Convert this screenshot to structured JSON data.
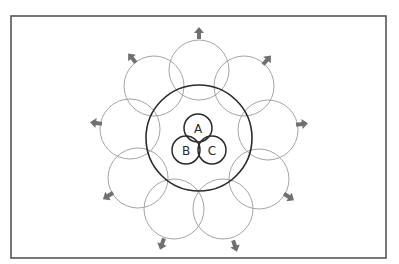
{
  "diagram": {
    "type": "venn-expansion",
    "frame": {
      "x": 11,
      "y": 16,
      "width": 375,
      "height": 242,
      "stroke": "#555555"
    },
    "center": {
      "x": 199,
      "y": 138
    },
    "main_circle": {
      "r": 53,
      "stroke": "#2a2a2a"
    },
    "inner_sets": [
      {
        "label": "A",
        "cx": 198,
        "cy": 128,
        "r": 14
      },
      {
        "label": "B",
        "cx": 186,
        "cy": 150,
        "r": 14
      },
      {
        "label": "C",
        "cx": 212,
        "cy": 150,
        "r": 14
      }
    ],
    "outer_circles": [
      {
        "cx": 199,
        "cy": 70,
        "r": 30
      },
      {
        "cx": 244,
        "cy": 86,
        "r": 30
      },
      {
        "cx": 268,
        "cy": 130,
        "r": 30
      },
      {
        "cx": 259,
        "cy": 179,
        "r": 30
      },
      {
        "cx": 223,
        "cy": 209,
        "r": 30
      },
      {
        "cx": 174,
        "cy": 209,
        "r": 30
      },
      {
        "cx": 138,
        "cy": 178,
        "r": 30
      },
      {
        "cx": 130,
        "cy": 129,
        "r": 30
      },
      {
        "cx": 154,
        "cy": 86,
        "r": 30
      }
    ],
    "arrows": [
      {
        "x": 199,
        "y": 33
      },
      {
        "x": 267,
        "y": 60
      },
      {
        "x": 302,
        "y": 124
      },
      {
        "x": 289,
        "y": 197
      },
      {
        "x": 235,
        "y": 246
      },
      {
        "x": 162,
        "y": 244
      },
      {
        "x": 108,
        "y": 196
      },
      {
        "x": 96,
        "y": 123
      },
      {
        "x": 132,
        "y": 58
      }
    ],
    "colors": {
      "outer_stroke": "#9a9a9a",
      "arrow_fill": "#707070",
      "inner_stroke": "#2a2a2a"
    }
  }
}
